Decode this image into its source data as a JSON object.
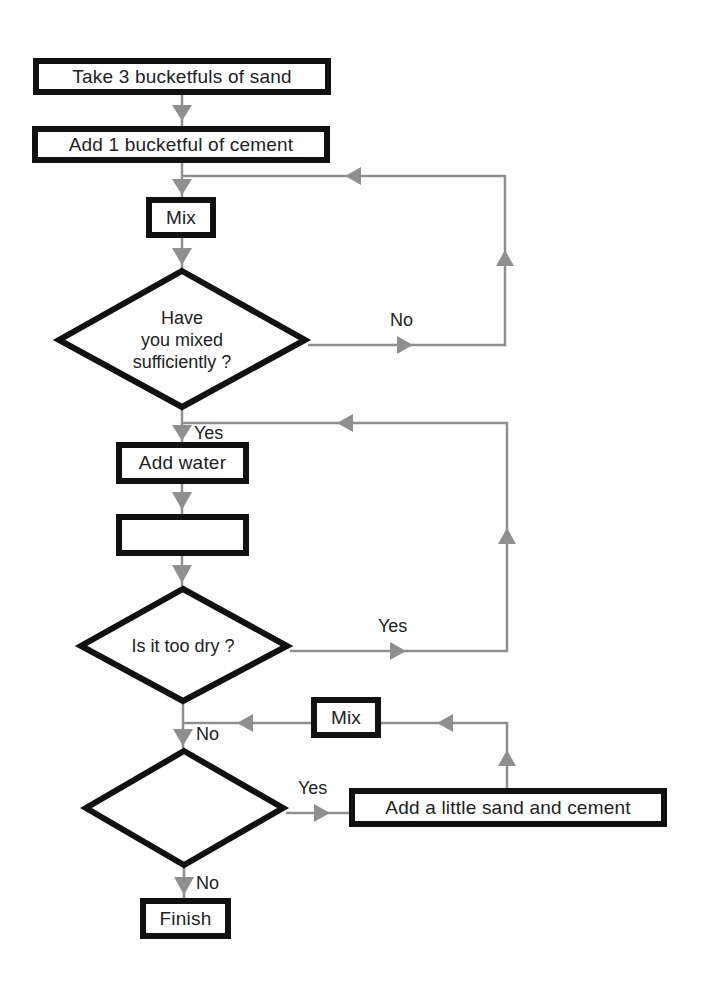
{
  "colors": {
    "connector": "#8f8f8f",
    "box_border": "#111111",
    "text": "#222222",
    "background": "#ffffff"
  },
  "flowchart": {
    "steps": {
      "take_sand": "Take 3 bucketfuls of sand",
      "add_cement": "Add 1 bucketful of cement",
      "mix_1": "Mix",
      "add_water": "Add water",
      "blank_step": "",
      "mix_2": "Mix",
      "add_sand_cement": "Add a little sand and cement",
      "finish": "Finish"
    },
    "decisions": {
      "mixed_sufficiently": {
        "lines": [
          "Have",
          "you mixed",
          "sufficiently ?"
        ]
      },
      "too_dry": {
        "lines": [
          "Is it too dry ?"
        ]
      },
      "blank_decision": {
        "lines": []
      }
    },
    "edge_labels": {
      "mixed_no": "No",
      "mixed_yes": "Yes",
      "dry_yes": "Yes",
      "dry_no": "No",
      "blank_yes": "Yes",
      "blank_no": "No"
    }
  }
}
